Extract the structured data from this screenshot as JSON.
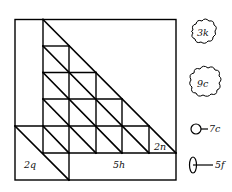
{
  "diagram": {
    "stroke_color": "#000000",
    "background": "#ffffff",
    "regions": {
      "bottom_left_label": "2q",
      "bottom_right_label": "5h",
      "corner_triangle_label": "2n"
    },
    "legend": [
      {
        "shape": "cloud-small",
        "label": "3k"
      },
      {
        "shape": "cloud-large",
        "label": "9c"
      },
      {
        "shape": "circle-with-line",
        "label": "7c"
      },
      {
        "shape": "ellipse-with-line",
        "label": "5f"
      }
    ]
  }
}
